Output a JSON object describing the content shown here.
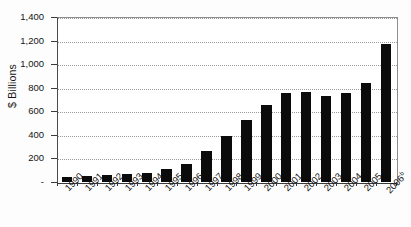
{
  "chart_data": {
    "type": "bar",
    "title": "",
    "subtitle": "",
    "xlabel": "",
    "ylabel": "$ Billions",
    "ylim": [
      0,
      1400
    ],
    "ytick_values": [
      0,
      200,
      400,
      600,
      800,
      1000,
      1200,
      1400
    ],
    "ytick_labels": [
      "-",
      "200",
      "400",
      "600",
      "800",
      "1,000",
      "1,200",
      "1,400"
    ],
    "grid": true,
    "legend": false,
    "legend_position": "none",
    "bar_color": "#0b0b0b",
    "categories": [
      "1990",
      "1991",
      "1992",
      "1993",
      "1994",
      "1995",
      "1996",
      "1997",
      "1998",
      "1999",
      "2000",
      "2001",
      "2002",
      "2003",
      "2004",
      "2005",
      "2006"
    ],
    "category_labels": [
      "1990",
      "1991",
      "1992",
      "1993",
      "1994",
      "1995",
      "1996",
      "1997",
      "1998",
      "1999",
      "2000",
      "2001",
      "2002",
      "2003",
      "2004",
      "2005",
      "2006"
    ],
    "last_category_superscript": "b",
    "values": [
      40,
      50,
      60,
      65,
      78,
      108,
      155,
      262,
      390,
      525,
      650,
      755,
      765,
      728,
      755,
      840,
      1170
    ],
    "series": [
      {
        "name": "",
        "values": [
          40,
          50,
          60,
          65,
          78,
          108,
          155,
          262,
          390,
          525,
          650,
          755,
          765,
          728,
          755,
          840,
          1170
        ]
      }
    ]
  },
  "axis": {
    "y_title": "$ Billions"
  }
}
